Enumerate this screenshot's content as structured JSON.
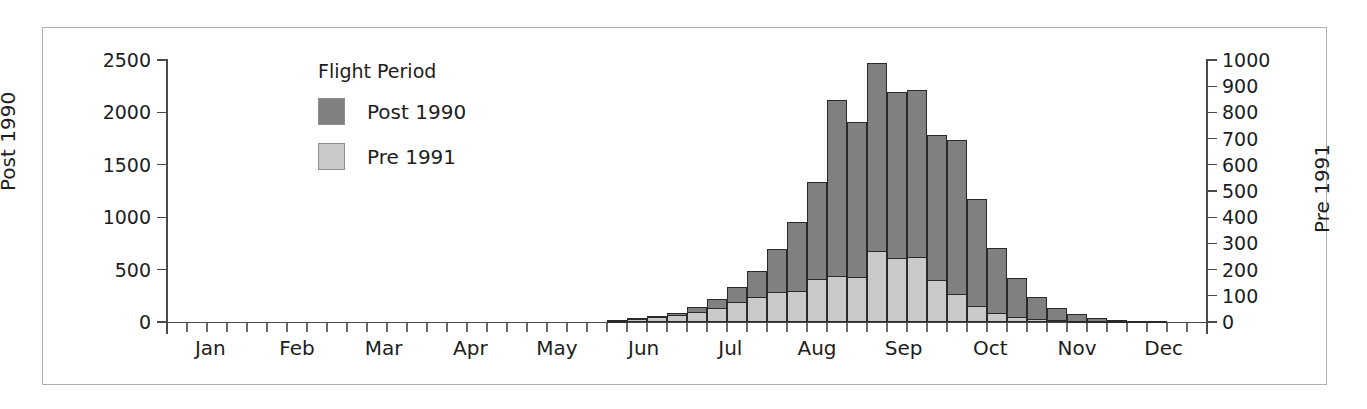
{
  "chart_data": {
    "type": "bar",
    "title": "",
    "subtitle": "",
    "xlabel": "",
    "ylabel": "Post 1990",
    "y2label": "Pre 1991",
    "grid": false,
    "legend_position": "inside-top-left",
    "legend_title": "Flight Period",
    "legend_entries": [
      {
        "name": "Post 1990",
        "color": "#808080"
      },
      {
        "name": "Pre 1991",
        "color": "#c9c9c9"
      }
    ],
    "ylim": [
      0,
      2500
    ],
    "y2lim": [
      0,
      1000
    ],
    "yticks": [
      0,
      500,
      1000,
      1500,
      2000,
      2500
    ],
    "y2ticks": [
      0,
      100,
      200,
      300,
      400,
      500,
      600,
      700,
      800,
      900,
      1000
    ],
    "month_labels": [
      "Jan",
      "Feb",
      "Mar",
      "Apr",
      "May",
      "Jun",
      "Jul",
      "Aug",
      "Sep",
      "Oct",
      "Nov",
      "Dec"
    ],
    "x_note": "weekly bins across the calendar year; ticks mark weeks, labels mark months",
    "n_bins": 52,
    "series": [
      {
        "name": "Post 1990",
        "axis": "left",
        "color": "#808080",
        "values": [
          0,
          0,
          0,
          0,
          0,
          0,
          0,
          0,
          0,
          0,
          0,
          0,
          0,
          0,
          0,
          0,
          0,
          0,
          0,
          0,
          0,
          0,
          20,
          35,
          60,
          85,
          140,
          215,
          330,
          490,
          700,
          950,
          1340,
          2120,
          1910,
          2470,
          2190,
          2210,
          1780,
          1740,
          1170,
          710,
          420,
          240,
          130,
          80,
          40,
          20,
          10,
          5,
          0,
          0
        ]
      },
      {
        "name": "Pre 1991",
        "axis": "right",
        "color": "#c9c9c9",
        "values": [
          0,
          0,
          0,
          0,
          0,
          0,
          0,
          0,
          0,
          0,
          0,
          0,
          0,
          0,
          0,
          0,
          0,
          0,
          0,
          0,
          0,
          0,
          5,
          10,
          18,
          25,
          40,
          55,
          75,
          95,
          115,
          120,
          165,
          175,
          170,
          270,
          245,
          250,
          160,
          105,
          60,
          35,
          20,
          12,
          8,
          5,
          3,
          2,
          0,
          0,
          0,
          0
        ]
      }
    ]
  },
  "legend": {
    "title": "Flight Period",
    "items": [
      {
        "label": "Post 1990"
      },
      {
        "label": "Pre 1991"
      }
    ]
  },
  "axes": {
    "left_title": "Post 1990",
    "right_title": "Pre 1991",
    "left_ticks": [
      "0",
      "500",
      "1000",
      "1500",
      "2000",
      "2500"
    ],
    "right_ticks": [
      "0",
      "100",
      "200",
      "300",
      "400",
      "500",
      "600",
      "700",
      "800",
      "900",
      "1000"
    ],
    "month_labels": [
      "Jan",
      "Feb",
      "Mar",
      "Apr",
      "May",
      "Jun",
      "Jul",
      "Aug",
      "Sep",
      "Oct",
      "Nov",
      "Dec"
    ]
  }
}
